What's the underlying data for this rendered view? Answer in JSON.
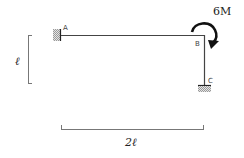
{
  "diagram": {
    "type": "frame-structure",
    "nodes": [
      {
        "id": "A",
        "label": "A",
        "support": "fixed"
      },
      {
        "id": "B",
        "label": "B",
        "support": "none"
      },
      {
        "id": "C",
        "label": "C",
        "support": "fixed"
      }
    ],
    "members": [
      {
        "from": "A",
        "to": "B",
        "orientation": "horizontal"
      },
      {
        "from": "B",
        "to": "C",
        "orientation": "vertical"
      }
    ],
    "loads": [
      {
        "type": "moment",
        "at": "B",
        "label": "6M",
        "direction": "clockwise"
      }
    ],
    "dimensions": {
      "vertical": "ℓ",
      "horizontal": "2ℓ"
    },
    "colors": {
      "member": "#444444",
      "dimension": "#777777",
      "moment_arrow": "#111111"
    }
  }
}
